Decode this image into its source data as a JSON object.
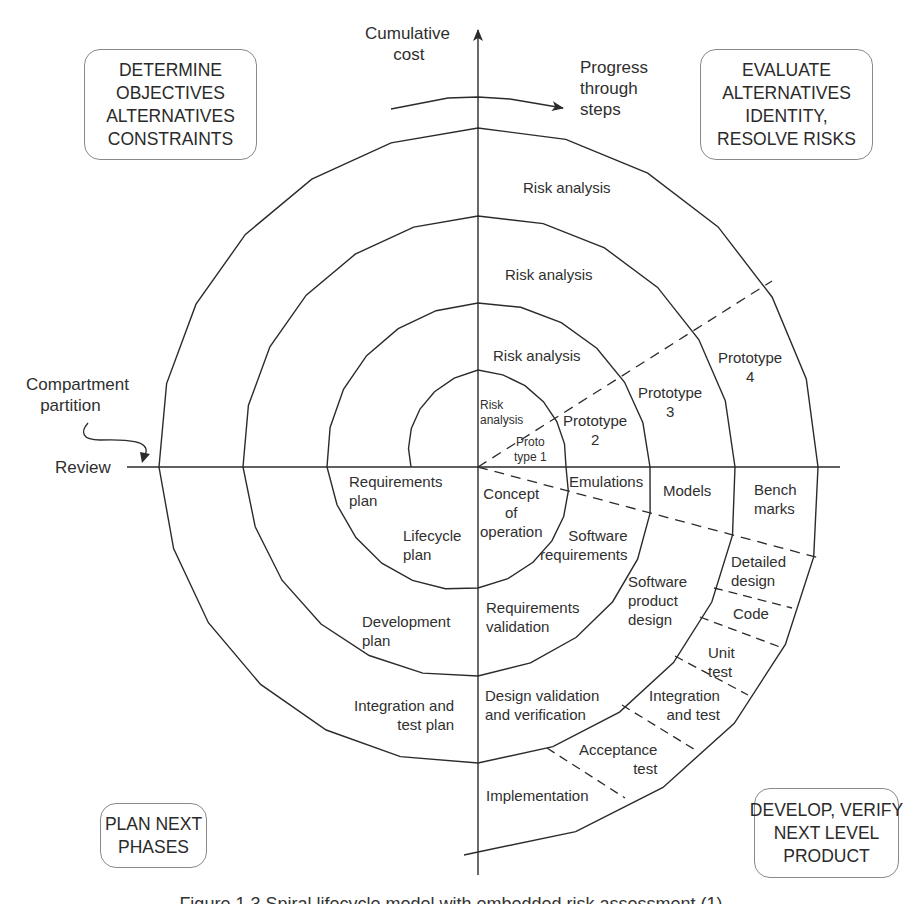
{
  "figure": {
    "axes": {
      "vertical_label": "Cumulative\n      cost",
      "horizontal_label": "Review",
      "progress_label": "Progress\nthrough\nsteps",
      "compartment_label": "Compartment\n   partition"
    },
    "quadrant_boxes": {
      "top_left": "DETERMINE\nOBJECTIVES\nALTERNATIVES\nCONSTRAINTS",
      "top_right": "EVALUATE\nALTERNATIVES\nIDENTITY,\nRESOLVE RISKS",
      "bottom_left": "PLAN NEXT\nPHASES",
      "bottom_right": "DEVELOP, VERIFY\nNEXT LEVEL\nPRODUCT"
    },
    "risk_analysis": {
      "ring1": "Risk\nanalysis",
      "ring2": "Risk analysis",
      "ring3": "Risk analysis",
      "ring4": "Risk analysis"
    },
    "prototypes": {
      "p1": "Proto\ntype 1",
      "p2": "Prototype\n2",
      "p3": "Prototype\n3",
      "p4": "Prototype\n4"
    },
    "plan_quadrant": {
      "requirements_plan": "Requirements\nplan",
      "lifecycle_plan": "Lifecycle\nplan",
      "development_plan": "Development\nplan",
      "integration_test_plan": "Integration and\ntest plan"
    },
    "develop_quadrant": {
      "concept_of_operation": "Concept\nof\noperation",
      "emulations": "Emulations",
      "models": "Models",
      "benchmarks": "Bench\nmarks",
      "software_requirements": "Software\nrequirements",
      "requirements_validation": "Requirements\nvalidation",
      "software_product_design": "Software\nproduct\ndesign",
      "detailed_design": "Detailed\ndesign",
      "code": "Code",
      "unit_test": "Unit\ntest",
      "integration_and_test": "Integration\nand test",
      "acceptance_test": "Acceptance\ntest",
      "design_validation": "Design validation\nand verification",
      "implementation": "Implementation"
    },
    "caption": "Figure 1.3   Spiral lifecycle model with embedded risk assessment (1)",
    "colors": {
      "line": "#2b2b2b",
      "box_border": "#8a8a8a",
      "text": "#2f2f2f"
    },
    "geometry": {
      "center": [
        478,
        467
      ],
      "spiral_anchors": [
        [
          411,
          467
        ],
        [
          478,
          370
        ],
        [
          566,
          467
        ],
        [
          478,
          588
        ],
        [
          327,
          467
        ],
        [
          478,
          303
        ],
        [
          650,
          467
        ],
        [
          478,
          676
        ],
        [
          243,
          467
        ],
        [
          478,
          216
        ],
        [
          735,
          467
        ],
        [
          478,
          763
        ],
        [
          159,
          467
        ],
        [
          478,
          128
        ],
        [
          818,
          467
        ],
        [
          478,
          852
        ]
      ],
      "h_axis": [
        127,
        840
      ],
      "v_axis": [
        26,
        875
      ]
    }
  }
}
